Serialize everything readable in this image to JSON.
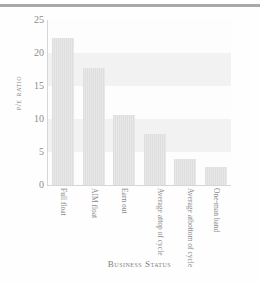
{
  "chart_data": {
    "type": "bar",
    "title": "",
    "xlabel": "Business Status",
    "ylabel": "P/E Ratio",
    "categories": [
      "Full float",
      "AIM float",
      "Earn out",
      "Average at top of cycle",
      "Average at bottom of cycle",
      "One-man band"
    ],
    "category_lines": [
      [
        "Full float"
      ],
      [
        "AIM float"
      ],
      [
        "Earn out"
      ],
      [
        "Average at",
        "top of cycle"
      ],
      [
        "Average at",
        "bottom of cycle"
      ],
      [
        "One-man band"
      ]
    ],
    "values": [
      22.3,
      17.8,
      10.6,
      7.7,
      3.9,
      2.7
    ],
    "ylim": [
      0,
      25
    ],
    "yticks": [
      0,
      5,
      10,
      15,
      20,
      25
    ],
    "ytick_labels": [
      "0",
      "5",
      "10",
      "15",
      "20",
      "25"
    ],
    "grid": true,
    "grid_style": "alternating-horizontal-bands",
    "legend": null,
    "bar_color": "#e2e2e2",
    "axis_color": "#d6d6d6",
    "text_color": "#8a8a8a",
    "background": "#fdfdfd"
  },
  "ytick_0": "0",
  "ytick_1": "5",
  "ytick_2": "10",
  "ytick_3": "15",
  "ytick_4": "20",
  "ytick_5": "25"
}
